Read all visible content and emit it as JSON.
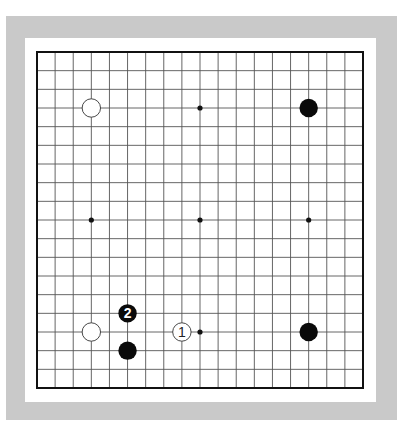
{
  "diagram": {
    "type": "go-board",
    "size": 19,
    "colors": {
      "frame": "#c9c9c9",
      "paper": "#ffffff",
      "line": "#555555",
      "border": "#111111",
      "black_stone": "#0a0a0a",
      "white_stone": "#ffffff"
    },
    "hoshi": [
      [
        3,
        3
      ],
      [
        9,
        3
      ],
      [
        15,
        3
      ],
      [
        3,
        9
      ],
      [
        9,
        9
      ],
      [
        15,
        9
      ],
      [
        3,
        15
      ],
      [
        9,
        15
      ],
      [
        15,
        15
      ]
    ],
    "stones": [
      {
        "color": "white",
        "col": 3,
        "row": 3,
        "label": ""
      },
      {
        "color": "black",
        "col": 15,
        "row": 3,
        "label": ""
      },
      {
        "color": "white",
        "col": 3,
        "row": 15,
        "label": ""
      },
      {
        "color": "black",
        "col": 5,
        "row": 16,
        "label": ""
      },
      {
        "color": "black",
        "col": 15,
        "row": 15,
        "label": ""
      },
      {
        "color": "white",
        "col": 8,
        "row": 15,
        "label": "1"
      },
      {
        "color": "black",
        "col": 5,
        "row": 14,
        "label": "2"
      }
    ]
  }
}
